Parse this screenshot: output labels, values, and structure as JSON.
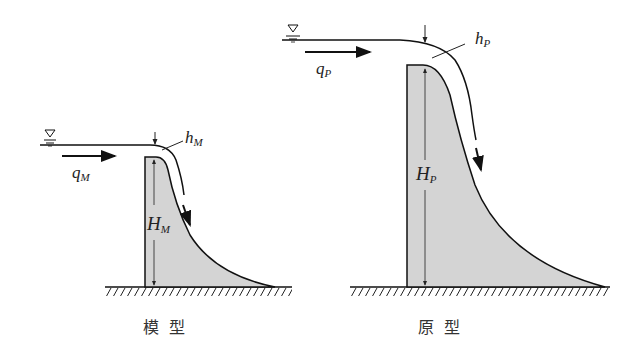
{
  "diagram": {
    "model": {
      "caption": "模  型",
      "discharge_label": "q",
      "discharge_sub": "M",
      "head_label": "h",
      "head_sub": "M",
      "height_label": "H",
      "height_sub": "M"
    },
    "prototype": {
      "caption": "原  型",
      "discharge_label": "q",
      "discharge_sub": "P",
      "head_label": "h",
      "head_sub": "P",
      "height_label": "H",
      "height_sub": "P"
    },
    "colors": {
      "dam_fill": "#d4d4d4",
      "line": "#1a1a1a"
    }
  }
}
